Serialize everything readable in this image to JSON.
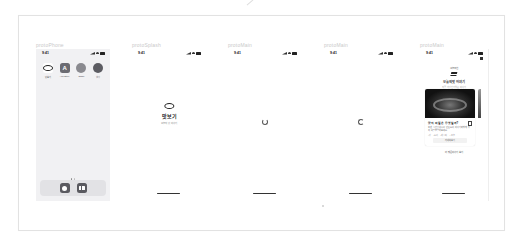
{
  "canvas": {
    "background": "#ffffff",
    "frame_border": "#e2e2e2"
  },
  "devices": [
    {
      "label": "protoPhone",
      "screen": "home",
      "status": {
        "time": "9:41"
      },
      "apps": [
        {
          "name": "맛보기",
          "icon": "lips-icon"
        },
        {
          "name": "App Store",
          "icon": "app-store-icon"
        },
        {
          "name": "Safari",
          "icon": "safari-icon"
        },
        {
          "name": "설정",
          "icon": "settings-icon"
        }
      ],
      "page_dots": 2,
      "dock": [
        {
          "name": "Phone",
          "icon": "circle-app-icon"
        },
        {
          "name": "Books",
          "icon": "book-app-icon"
        }
      ]
    },
    {
      "label": "protoSplash",
      "screen": "splash",
      "status": {
        "time": "9:41"
      },
      "splash": {
        "title": "맛보기",
        "subtitle": "오늘의 맛 이야기"
      }
    },
    {
      "label": "protoMain",
      "screen": "loading",
      "status": {
        "time": "9:41"
      }
    },
    {
      "label": "protoMain",
      "screen": "loading",
      "status": {
        "time": "9:41"
      }
    },
    {
      "label": "protoMain",
      "screen": "feed",
      "status": {
        "time": "9:41"
      },
      "feed": {
        "eyebrow": "오늘 추천",
        "title": "오늘의 맛 이야기",
        "subtitle": "지금 가장 인기있는 이야기",
        "card": {
          "title": "맛의 비밀은 무엇일까?",
          "body": "오랜 시간 정성으로 만든 요리 이야기와 함께 맛의 비밀을 알아보세요.",
          "tags": [
            "#맛",
            "#요리",
            "#레시피",
            "#오늘"
          ],
          "button": "자세히 보기"
        },
        "link": "더 많은 이야기 보기"
      }
    }
  ]
}
